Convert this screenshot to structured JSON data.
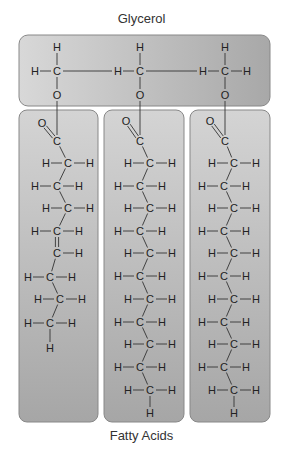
{
  "labels": {
    "top": "Glycerol",
    "bottom": "Fatty Acids"
  },
  "colors": {
    "box_light": "#d8d8d8",
    "box_dark": "#a8a8a8",
    "box_border": "#888888",
    "bond": "#333333",
    "text": "#222222"
  },
  "glycerol": {
    "box": {
      "x": 19,
      "y": 35,
      "w": 251,
      "h": 71,
      "r": 9
    },
    "carbons": [
      {
        "x": 57,
        "y": 71,
        "left_h": true,
        "right_h": false
      },
      {
        "x": 140,
        "y": 71,
        "left_h": true,
        "right_h": false
      },
      {
        "x": 225,
        "y": 71,
        "left_h": true,
        "right_h": true
      }
    ],
    "atom_labels": {
      "H": "H",
      "C": "C",
      "O": "O"
    }
  },
  "fatty_acids": [
    {
      "name": "unsaturated",
      "box": {
        "x": 19,
        "y": 110,
        "w": 79,
        "h": 312,
        "r": 8
      },
      "carbonyl": {
        "o": {
          "x": 42,
          "y": 123
        },
        "c": {
          "x": 57,
          "y": 141
        }
      },
      "glycerol_link_x": 57,
      "chain": [
        {
          "x": 68,
          "y": 163,
          "h_left": true,
          "h_right": true,
          "double_to_next": false
        },
        {
          "x": 57,
          "y": 186,
          "h_left": true,
          "h_right": true,
          "double_to_next": false
        },
        {
          "x": 68,
          "y": 208,
          "h_left": true,
          "h_right": true,
          "double_to_next": false
        },
        {
          "x": 57,
          "y": 231,
          "h_left": true,
          "h_right": true,
          "double_to_next": true
        },
        {
          "x": 57,
          "y": 253,
          "h_left": false,
          "h_right": true,
          "double_to_next": false
        },
        {
          "x": 50,
          "y": 277,
          "h_left": true,
          "h_right": true,
          "double_to_next": false
        },
        {
          "x": 60,
          "y": 299,
          "h_left": true,
          "h_right": true,
          "double_to_next": false
        },
        {
          "x": 50,
          "y": 323,
          "h_left": true,
          "h_right": true,
          "double_to_next": false
        }
      ],
      "terminal_h": {
        "x": 50,
        "y": 348
      }
    },
    {
      "name": "saturated-1",
      "box": {
        "x": 104,
        "y": 110,
        "w": 80,
        "h": 312,
        "r": 8
      },
      "carbonyl": {
        "o": {
          "x": 126,
          "y": 121
        },
        "c": {
          "x": 140,
          "y": 141
        }
      },
      "glycerol_link_x": 140,
      "chain": [
        {
          "x": 150,
          "y": 163,
          "h_left": true,
          "h_right": true,
          "double_to_next": false
        },
        {
          "x": 140,
          "y": 186,
          "h_left": true,
          "h_right": true,
          "double_to_next": false
        },
        {
          "x": 150,
          "y": 208,
          "h_left": true,
          "h_right": true,
          "double_to_next": false
        },
        {
          "x": 140,
          "y": 231,
          "h_left": true,
          "h_right": true,
          "double_to_next": false
        },
        {
          "x": 150,
          "y": 253,
          "h_left": true,
          "h_right": true,
          "double_to_next": false
        },
        {
          "x": 140,
          "y": 276,
          "h_left": true,
          "h_right": true,
          "double_to_next": false
        },
        {
          "x": 150,
          "y": 299,
          "h_left": true,
          "h_right": true,
          "double_to_next": false
        },
        {
          "x": 140,
          "y": 322,
          "h_left": true,
          "h_right": true,
          "double_to_next": false
        },
        {
          "x": 150,
          "y": 344,
          "h_left": true,
          "h_right": true,
          "double_to_next": false
        },
        {
          "x": 140,
          "y": 367,
          "h_left": true,
          "h_right": true,
          "double_to_next": false
        },
        {
          "x": 150,
          "y": 390,
          "h_left": true,
          "h_right": true,
          "double_to_next": false
        }
      ],
      "terminal_h": {
        "x": 150,
        "y": 413
      }
    },
    {
      "name": "saturated-2",
      "box": {
        "x": 190,
        "y": 110,
        "w": 80,
        "h": 312,
        "r": 8
      },
      "carbonyl": {
        "o": {
          "x": 210,
          "y": 121
        },
        "c": {
          "x": 225,
          "y": 141
        }
      },
      "glycerol_link_x": 225,
      "chain": [
        {
          "x": 234,
          "y": 163,
          "h_left": true,
          "h_right": true,
          "double_to_next": false
        },
        {
          "x": 224,
          "y": 186,
          "h_left": true,
          "h_right": true,
          "double_to_next": false
        },
        {
          "x": 234,
          "y": 208,
          "h_left": true,
          "h_right": true,
          "double_to_next": false
        },
        {
          "x": 224,
          "y": 231,
          "h_left": true,
          "h_right": true,
          "double_to_next": false
        },
        {
          "x": 234,
          "y": 253,
          "h_left": true,
          "h_right": true,
          "double_to_next": false
        },
        {
          "x": 224,
          "y": 276,
          "h_left": true,
          "h_right": true,
          "double_to_next": false
        },
        {
          "x": 234,
          "y": 299,
          "h_left": true,
          "h_right": true,
          "double_to_next": false
        },
        {
          "x": 224,
          "y": 322,
          "h_left": true,
          "h_right": true,
          "double_to_next": false
        },
        {
          "x": 234,
          "y": 344,
          "h_left": true,
          "h_right": true,
          "double_to_next": false
        },
        {
          "x": 224,
          "y": 367,
          "h_left": true,
          "h_right": true,
          "double_to_next": false
        },
        {
          "x": 234,
          "y": 390,
          "h_left": true,
          "h_right": true,
          "double_to_next": false
        }
      ],
      "terminal_h": {
        "x": 234,
        "y": 413
      }
    }
  ]
}
